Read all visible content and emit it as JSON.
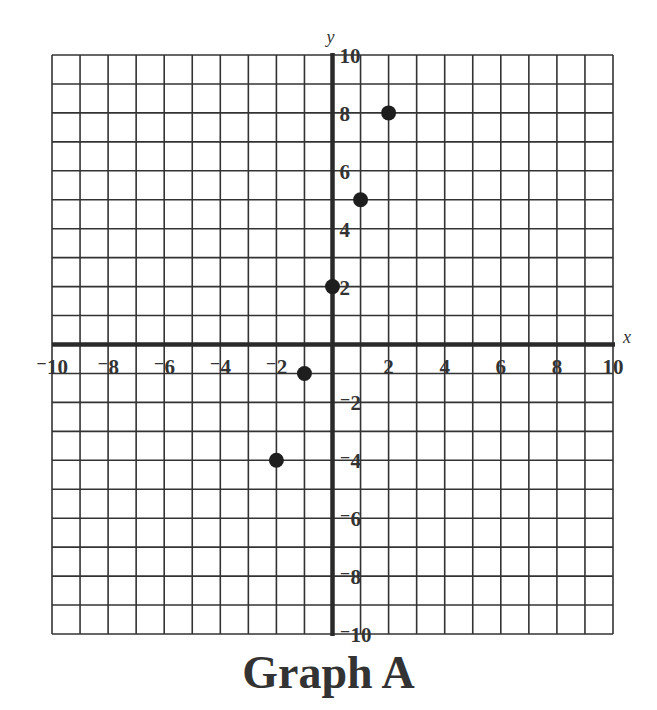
{
  "chart_data": {
    "type": "scatter",
    "title": "Graph A",
    "xlabel": "x",
    "ylabel": "y",
    "xlim": [
      -10,
      10
    ],
    "ylim": [
      -10,
      10
    ],
    "grid": true,
    "grid_step": 1,
    "x_tick_labels": [
      "⁻10",
      "⁻8",
      "⁻6",
      "⁻4",
      "⁻2",
      "2",
      "4",
      "6",
      "8",
      "10"
    ],
    "x_ticks": [
      -10,
      -8,
      -6,
      -4,
      -2,
      2,
      4,
      6,
      8,
      10
    ],
    "y_tick_labels": [
      "10",
      "8",
      "6",
      "4",
      "2",
      "⁻2",
      "⁻4",
      "⁻6",
      "⁻8",
      "⁻10"
    ],
    "y_ticks": [
      10,
      8,
      6,
      4,
      2,
      -2,
      -4,
      -6,
      -8,
      -10
    ],
    "series": [
      {
        "name": "points",
        "points": [
          {
            "x": 2,
            "y": 8
          },
          {
            "x": 1,
            "y": 5
          },
          {
            "x": 0,
            "y": 2
          },
          {
            "x": -1,
            "y": -1
          },
          {
            "x": -2,
            "y": -4
          }
        ]
      }
    ],
    "legend": null
  },
  "colors": {
    "grid": "#333333",
    "axis": "#2a2a2a",
    "point": "#1e1e1e",
    "text": "#333333"
  }
}
